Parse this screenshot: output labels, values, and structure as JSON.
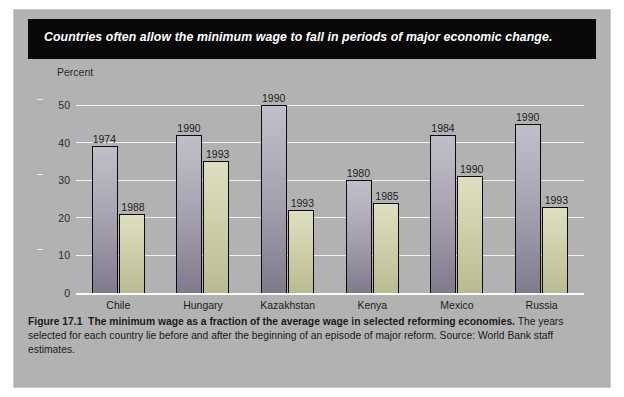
{
  "banner": {
    "headline": "Countries often allow the minimum wage to fall in periods of major economic change."
  },
  "caption": {
    "figure_number": "Figure 17.1",
    "lead": "The minimum wage as a fraction of the average wage in selected reforming economies.",
    "body": " The years selected for each country lie before and after the beginning of an episode of major reform. Source: World Bank staff estimates."
  },
  "colors": {
    "plate_background": "#b2b2b2",
    "banner_background": "#090909",
    "bar_before": "#a29eac",
    "bar_after": "#c6c7a0",
    "gridline": "#f0f0f0",
    "bar_outline": "#0c0c0c"
  },
  "chart_data": {
    "type": "bar",
    "title": "Countries often allow the minimum wage to fall in periods of major economic change.",
    "xlabel": "",
    "ylabel": "Percent",
    "ylim": [
      0,
      50
    ],
    "yticks": [
      0,
      10,
      20,
      30,
      40,
      50
    ],
    "ytick_labels": [
      "0",
      "10",
      "20",
      "30",
      "40",
      "50"
    ],
    "grid": true,
    "legend_position": "none",
    "categories": [
      "Chile",
      "Hungary",
      "Kazakhstan",
      "Kenya",
      "Mexico",
      "Russia"
    ],
    "series": [
      {
        "name": "Before reform",
        "point_labels": [
          "1974",
          "1990",
          "1990",
          "1980",
          "1984",
          "1990"
        ],
        "values": [
          39,
          42,
          50,
          30,
          42,
          45
        ]
      },
      {
        "name": "After reform",
        "point_labels": [
          "1988",
          "1993",
          "1993",
          "1985",
          "1990",
          "1993"
        ],
        "values": [
          21,
          35,
          22,
          24,
          31,
          23
        ]
      }
    ],
    "groups": [
      {
        "category": "Chile",
        "bars": [
          {
            "label": "1974",
            "value": 39,
            "phase": "before"
          },
          {
            "label": "1988",
            "value": 21,
            "phase": "after"
          }
        ]
      },
      {
        "category": "Hungary",
        "bars": [
          {
            "label": "1990",
            "value": 42,
            "phase": "before"
          },
          {
            "label": "1993",
            "value": 35,
            "phase": "after"
          }
        ]
      },
      {
        "category": "Kazakhstan",
        "bars": [
          {
            "label": "1990",
            "value": 50,
            "phase": "before"
          },
          {
            "label": "1993",
            "value": 22,
            "phase": "after"
          }
        ]
      },
      {
        "category": "Kenya",
        "bars": [
          {
            "label": "1980",
            "value": 30,
            "phase": "before"
          },
          {
            "label": "1985",
            "value": 24,
            "phase": "after"
          }
        ]
      },
      {
        "category": "Mexico",
        "bars": [
          {
            "label": "1984",
            "value": 42,
            "phase": "before"
          },
          {
            "label": "1990",
            "value": 31,
            "phase": "after"
          }
        ]
      },
      {
        "category": "Russia",
        "bars": [
          {
            "label": "1990",
            "value": 45,
            "phase": "before"
          },
          {
            "label": "1993",
            "value": 23,
            "phase": "after"
          }
        ]
      }
    ]
  }
}
